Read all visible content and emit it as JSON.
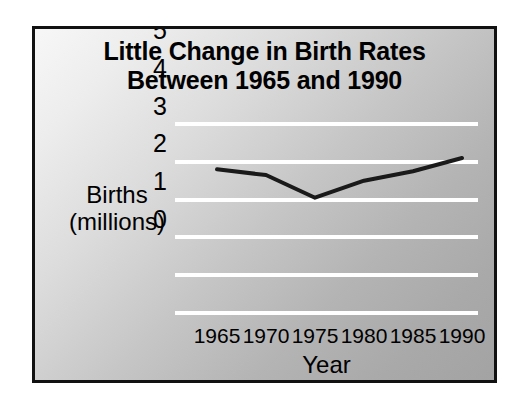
{
  "figure": {
    "border_color": "#111111",
    "background_light": "#f7f7f7",
    "background_dark": "#a3a3a3"
  },
  "chart_data": {
    "type": "line",
    "title": "Little Change in Birth Rates Between 1965 and 1990",
    "title_line1": "Little Change in Birth Rates",
    "title_line2": "Between 1965 and 1990",
    "xlabel": "Year",
    "ylabel": "Births (millions)",
    "ylabel_line1": "Births",
    "ylabel_line2": "(millions)",
    "categories": [
      "1965",
      "1970",
      "1975",
      "1980",
      "1985",
      "1990"
    ],
    "x": [
      1965,
      1970,
      1975,
      1980,
      1985,
      1990
    ],
    "values": [
      3.8,
      3.65,
      3.05,
      3.5,
      3.75,
      4.1
    ],
    "series": [
      {
        "name": "Births (millions)",
        "values": [
          3.8,
          3.65,
          3.05,
          3.5,
          3.75,
          4.1
        ],
        "color": "#1a1a1a",
        "line_width": 4
      }
    ],
    "ylim": [
      0,
      5
    ],
    "xlim": [
      1965,
      1990
    ],
    "yticks": [
      "5",
      "4",
      "3",
      "2",
      "1",
      "0"
    ],
    "ytick_values": [
      5,
      4,
      3,
      2,
      1,
      0
    ],
    "xticks": [
      "1965",
      "1970",
      "1975",
      "1980",
      "1985",
      "1990"
    ],
    "grid": true,
    "grid_axis": "y",
    "grid_color": "#ffffff",
    "legend": false,
    "legend_position": "none"
  }
}
